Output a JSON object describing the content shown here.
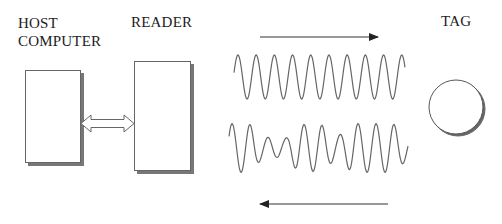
{
  "diagram": {
    "labels": {
      "host": [
        "HOST",
        "COMPUTER"
      ],
      "reader": "READER",
      "tag": "TAG"
    },
    "nodes": [
      {
        "id": "host",
        "shape": "rectangle",
        "label": "HOST COMPUTER"
      },
      {
        "id": "reader",
        "shape": "rectangle",
        "label": "READER"
      },
      {
        "id": "tag",
        "shape": "circle",
        "label": "TAG"
      }
    ],
    "edges": [
      {
        "from": "host",
        "to": "reader",
        "type": "double-arrow"
      },
      {
        "from": "reader",
        "to": "tag",
        "type": "arrow",
        "signal": "carrier wave (uniform sine)"
      },
      {
        "from": "tag",
        "to": "reader",
        "type": "arrow",
        "signal": "modulated wave"
      }
    ],
    "colors": {
      "stroke": "#555555",
      "shadow": "#777777",
      "arrow": "#222222",
      "wave": "#666666"
    }
  }
}
